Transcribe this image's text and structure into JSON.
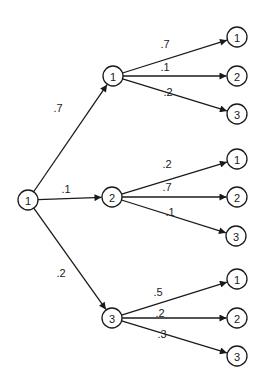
{
  "diagram": {
    "type": "probability-tree",
    "root": {
      "label": "1",
      "x": 28,
      "y": 200
    },
    "branches": [
      {
        "label": "1",
        "x": 113,
        "y": 76,
        "prob": ".7",
        "prob_pos": [
          58,
          112
        ],
        "leaves": [
          {
            "label": "1",
            "x": 237,
            "y": 37,
            "prob": ".7",
            "prob_pos": [
              165,
              48
            ]
          },
          {
            "label": "2",
            "x": 237,
            "y": 76,
            "prob": ".1",
            "prob_pos": [
              165,
              71
            ]
          },
          {
            "label": "3",
            "x": 237,
            "y": 114,
            "prob": ".2",
            "prob_pos": [
              168,
              96
            ]
          }
        ]
      },
      {
        "label": "2",
        "x": 112,
        "y": 197,
        "prob": ".1",
        "prob_pos": [
          66,
          193
        ],
        "leaves": [
          {
            "label": "1",
            "x": 237,
            "y": 159,
            "prob": ".2",
            "prob_pos": [
              167,
              168
            ]
          },
          {
            "label": "2",
            "x": 237,
            "y": 197,
            "prob": ".7",
            "prob_pos": [
              167,
              191
            ]
          },
          {
            "label": "3",
            "x": 236,
            "y": 236,
            "prob": ".1",
            "prob_pos": [
              170,
              216
            ]
          }
        ]
      },
      {
        "label": "3",
        "x": 112,
        "y": 318,
        "prob": ".2",
        "prob_pos": [
          61,
          277
        ],
        "leaves": [
          {
            "label": "1",
            "x": 237,
            "y": 279,
            "prob": ".5",
            "prob_pos": [
              158,
              296
            ]
          },
          {
            "label": "2",
            "x": 237,
            "y": 318,
            "prob": ".2",
            "prob_pos": [
              160,
              317
            ]
          },
          {
            "label": "3",
            "x": 237,
            "y": 356,
            "prob": ".3",
            "prob_pos": [
              162,
              338
            ]
          }
        ]
      }
    ],
    "node_radius": 10,
    "color": "#1a1a1a"
  }
}
